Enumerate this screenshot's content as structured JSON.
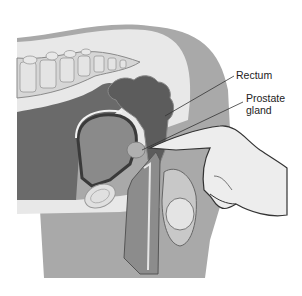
{
  "figure": {
    "type": "anatomical-illustration",
    "colors": {
      "background": "#ffffff",
      "body_outer": "#a9a9a9",
      "body_inner": "#e6e6e6",
      "cavity": "#6e6e6e",
      "rectum": "#5c5c5c",
      "bladder": "#8a8a8a",
      "bone": "#dcdcdc",
      "hand": "#ececec",
      "outline": "#444444"
    }
  },
  "labels": {
    "rectum": "Rectum",
    "prostate_line1": "Prostate",
    "prostate_line2": "gland"
  }
}
